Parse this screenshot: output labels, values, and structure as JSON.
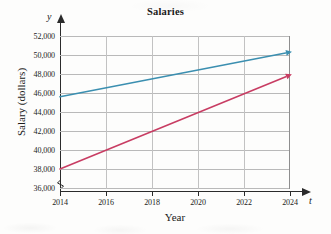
{
  "chart_data": {
    "type": "line",
    "title": "Salaries",
    "xlabel": "Year",
    "ylabel": "Salary (dollars)",
    "x_axis_variable": "t",
    "y_axis_variable": "y",
    "x": [
      2014,
      2016,
      2018,
      2020,
      2022,
      2024
    ],
    "xtick_labels": [
      "2014",
      "2016",
      "2018",
      "2020",
      "2022",
      "2024"
    ],
    "xlim": [
      2014,
      2024
    ],
    "ytick_labels": [
      "36,000",
      "38,000",
      "40,000",
      "42,000",
      "44,000",
      "46,000",
      "48,000",
      "50,000",
      "52,000"
    ],
    "yticks": [
      36000,
      38000,
      40000,
      42000,
      44000,
      46000,
      48000,
      50000,
      52000
    ],
    "ylim": [
      36000,
      52000
    ],
    "y_axis_break": true,
    "grid": true,
    "legend": "none",
    "series": [
      {
        "name": "blue-line",
        "color": "#3b8fb0",
        "arrow_end": true,
        "points": [
          {
            "x": 2014,
            "y": 45600
          },
          {
            "x": 2024,
            "y": 50300
          }
        ]
      },
      {
        "name": "red-line",
        "color": "#c83d63",
        "arrow_end": true,
        "points": [
          {
            "x": 2014,
            "y": 38000
          },
          {
            "x": 2024,
            "y": 47900
          }
        ]
      }
    ]
  },
  "chart": {
    "title": "Salaries",
    "xlabel": "Year",
    "ylabel": "Salary (dollars)",
    "x_axis_variable": "t",
    "y_axis_variable": "y",
    "ytick_labels": [
      "52,000",
      "50,000",
      "48,000",
      "46,000",
      "44,000",
      "42,000",
      "40,000",
      "38,000",
      "36,000"
    ],
    "xtick_labels": [
      "2014",
      "2016",
      "2018",
      "2020",
      "2022",
      "2024"
    ],
    "colors": {
      "blue_series": "#3b8fb0",
      "red_series": "#c83d63",
      "gridline": "#b9b9b9",
      "axis": "#2b2b2b",
      "background": "#fdfdfc"
    }
  }
}
